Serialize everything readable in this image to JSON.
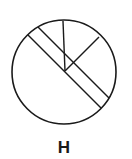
{
  "figure": {
    "label": "H",
    "stroke_color": "#1a1a1a",
    "fill_color": "#ffffff",
    "circle": {
      "cx": 64,
      "cy": 72,
      "r": 52
    },
    "center_point": {
      "x": 65,
      "y": 71
    },
    "radial_lines": [
      {
        "name": "top-line",
        "x2": 63,
        "y2": 21
      },
      {
        "name": "upper-right-line",
        "x2": 99,
        "y2": 37
      }
    ],
    "band": {
      "description": "diagonal double-line band from upper-left to lower-right",
      "line1": {
        "x1": 26,
        "y1": 33,
        "x2": 101,
        "y2": 108
      },
      "line2": {
        "x1": 31,
        "y1": 28,
        "x2": 105,
        "y2": 102
      }
    }
  }
}
